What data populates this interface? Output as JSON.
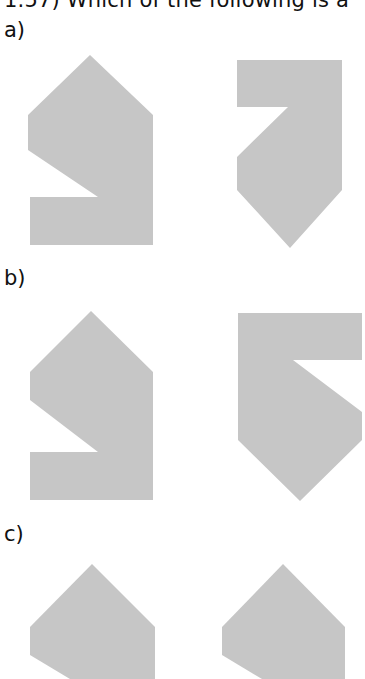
{
  "question": {
    "text": "1.57) Which of the following is a"
  },
  "options": [
    {
      "label": "a)"
    },
    {
      "label": "b)"
    },
    {
      "label": "c)"
    }
  ],
  "colors": {
    "shape_fill": "#c6c6c6",
    "background": "#ffffff"
  }
}
